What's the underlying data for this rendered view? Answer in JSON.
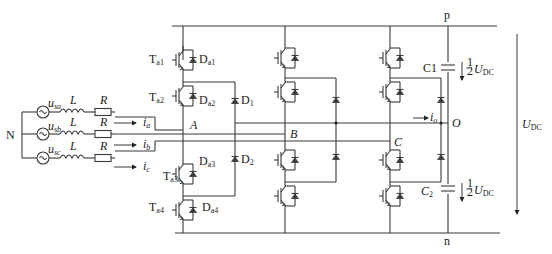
{
  "diagram": {
    "type": "three-level NPC rectifier circuit",
    "nodes": {
      "positive_rail": "p",
      "negative_rail": "n",
      "neutral_point": "O",
      "source_neutral": "N",
      "phase_points": [
        "A",
        "B",
        "C"
      ]
    },
    "sources": [
      {
        "name": "u",
        "sub": "sa",
        "inductor": "L",
        "resistor": "R",
        "current": "i",
        "current_sub": "a"
      },
      {
        "name": "u",
        "sub": "sb",
        "inductor": "L",
        "resistor": "R",
        "current": "i",
        "current_sub": "b"
      },
      {
        "name": "u",
        "sub": "sc",
        "inductor": "L",
        "resistor": "R",
        "current": "i",
        "current_sub": "c"
      }
    ],
    "leg_a": {
      "switches": [
        {
          "t": "T",
          "t_sub": "a1",
          "d": "D",
          "d_sub": "a1"
        },
        {
          "t": "T",
          "t_sub": "a2",
          "d": "D",
          "d_sub": "a2"
        },
        {
          "t": "T",
          "t_sub": "a3",
          "d": "D",
          "d_sub": "a3"
        },
        {
          "t": "T",
          "t_sub": "a4",
          "d": "D",
          "d_sub": "a4"
        }
      ],
      "clamp_diodes": [
        {
          "d": "D",
          "sub": "1"
        },
        {
          "d": "D",
          "sub": "2"
        }
      ]
    },
    "neutral_current": {
      "name": "i",
      "sub": "o"
    },
    "capacitors": [
      {
        "name": "C1",
        "voltage_frac": "1/2",
        "voltage": "U",
        "voltage_sub": "DC"
      },
      {
        "name": "C",
        "sub": "2",
        "voltage_frac": "1/2",
        "voltage": "U",
        "voltage_sub": "DC"
      }
    ],
    "dc_voltage": {
      "name": "U",
      "sub": "DC"
    }
  }
}
